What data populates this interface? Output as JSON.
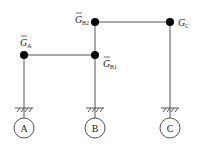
{
  "diagram": {
    "nodes": [
      {
        "id": "A",
        "label": "G",
        "sub": "A",
        "bar": true,
        "x": 24,
        "y": 55
      },
      {
        "id": "B1",
        "label": "G",
        "sub": "B1",
        "bar": true,
        "x": 95,
        "y": 55
      },
      {
        "id": "B2",
        "label": "G",
        "sub": "B2",
        "bar": true,
        "x": 95,
        "y": 22
      },
      {
        "id": "C",
        "label": "G",
        "sub": "C",
        "bar": false,
        "x": 170,
        "y": 22
      }
    ],
    "edges": [
      {
        "from": "A",
        "to": "B1"
      },
      {
        "from": "B2",
        "to": "C"
      },
      {
        "from": "B2",
        "to": "B1"
      }
    ],
    "supports": [
      {
        "id": "A",
        "label": "A",
        "x": 24,
        "ground_y": 108,
        "circle_y": 128
      },
      {
        "id": "B",
        "label": "B",
        "x": 95,
        "ground_y": 108,
        "circle_y": 128
      },
      {
        "id": "C",
        "label": "C",
        "x": 170,
        "ground_y": 108,
        "circle_y": 128
      }
    ],
    "colors": {
      "line": "#555555",
      "node": "#000000"
    }
  }
}
